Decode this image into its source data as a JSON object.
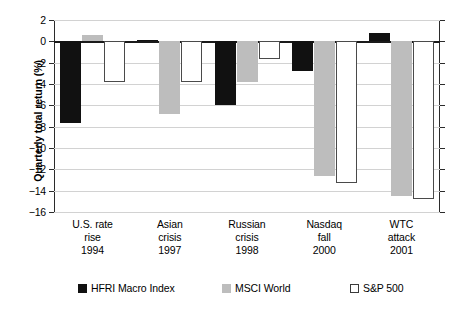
{
  "chart_data": {
    "type": "bar",
    "title": "",
    "xlabel": "",
    "ylabel": "Quarterly total return (%)",
    "ylim": [
      -16,
      2
    ],
    "yticks": [
      2,
      0,
      -2,
      -4,
      -6,
      -8,
      -10,
      -12,
      -14,
      -16
    ],
    "ytick_labels": [
      "2",
      "0",
      "−2",
      "−4",
      "−6",
      "−8",
      "−10",
      "−12",
      "−14",
      "−16"
    ],
    "grid": true,
    "legend_position": "bottom",
    "categories": [
      "U.S. rate rise 1994",
      "Asian crisis 1997",
      "Russian crisis 1998",
      "Nasdaq fall 2000",
      "WTC attack 2001"
    ],
    "category_lines": [
      [
        "U.S. rate",
        "rise",
        "1994"
      ],
      [
        "Asian",
        "crisis",
        "1997"
      ],
      [
        "Russian",
        "crisis",
        "1998"
      ],
      [
        "Nasdaq",
        "fall",
        "2000"
      ],
      [
        "WTC",
        "attack",
        "2001"
      ]
    ],
    "series": [
      {
        "name": "HFRI Macro Index",
        "color": "#111111",
        "values": [
          -7.7,
          0.15,
          -6.0,
          -2.8,
          0.8
        ]
      },
      {
        "name": "MSCI World",
        "color": "#bdbdbd",
        "values": [
          0.6,
          -6.8,
          -3.8,
          -12.6,
          -14.5
        ]
      },
      {
        "name": "S&P 500",
        "color": "#ffffff",
        "values": [
          -3.8,
          -3.8,
          -1.7,
          -13.3,
          -14.8
        ]
      }
    ]
  },
  "legend": {
    "items": [
      {
        "label": "HFRI Macro Index",
        "swatch": "black-square-icon"
      },
      {
        "label": "MSCI World",
        "swatch": "gray-square-icon"
      },
      {
        "label": "S&P 500",
        "swatch": "white-square-icon"
      }
    ]
  }
}
